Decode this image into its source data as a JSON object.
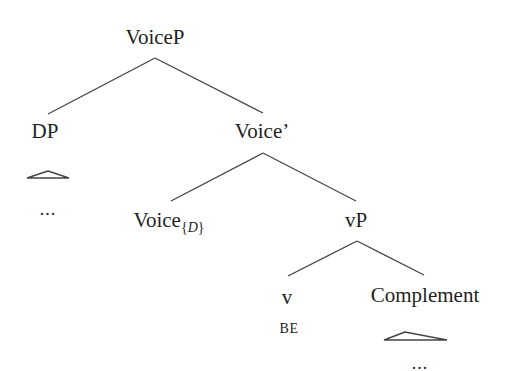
{
  "diagram": {
    "type": "syntax-tree",
    "nodes": {
      "root": {
        "label": "VoiceP"
      },
      "dp": {
        "label": "DP",
        "leaf": "..."
      },
      "voice_bar": {
        "label": "Voice’"
      },
      "voice_head": {
        "label": "Voice",
        "subscript_open": "{",
        "subscript_var": "D",
        "subscript_close": "}"
      },
      "vp": {
        "label": "vP"
      },
      "v": {
        "label": "v",
        "leaf": "BE"
      },
      "complement": {
        "label": "Complement",
        "leaf": "..."
      }
    },
    "edges": [
      [
        "VoiceP",
        "DP"
      ],
      [
        "VoiceP",
        "Voice’"
      ],
      [
        "Voice’",
        "Voice{D}"
      ],
      [
        "Voice’",
        "vP"
      ],
      [
        "vP",
        "v"
      ],
      [
        "vP",
        "Complement"
      ]
    ],
    "line_color": "#444444",
    "text_color": "#1f1f1f"
  }
}
